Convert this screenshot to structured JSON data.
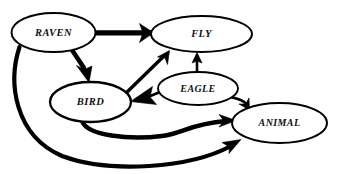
{
  "diagram": {
    "canvas": {
      "width": 338,
      "height": 174,
      "background": "#ffffff"
    },
    "style": {
      "node_fill": "#ffffff",
      "node_stroke": "#000000",
      "edge_color": "#000000",
      "label_color": "#111111"
    },
    "nodes": [
      {
        "id": "raven",
        "label": "RAVEN",
        "cx": 53.5,
        "cy": 32.5,
        "rx": 42,
        "ry": 19.5,
        "stroke_width": 1.9,
        "font_size": 10.5
      },
      {
        "id": "fly",
        "label": "FLY",
        "cx": 201.5,
        "cy": 34,
        "rx": 50.5,
        "ry": 18,
        "stroke_width": 1.9,
        "font_size": 10.5
      },
      {
        "id": "bird",
        "label": "BIRD",
        "cx": 90.5,
        "cy": 102,
        "rx": 40.5,
        "ry": 20,
        "stroke_width": 2.3,
        "font_size": 10.5
      },
      {
        "id": "eagle",
        "label": "EAGLE",
        "cx": 198,
        "cy": 88.5,
        "rx": 40,
        "ry": 16.5,
        "stroke_width": 1.9,
        "font_size": 10
      },
      {
        "id": "animal",
        "label": "ANIMAL",
        "cx": 279.5,
        "cy": 123,
        "rx": 47.5,
        "ry": 20,
        "stroke_width": 1.9,
        "font_size": 10
      }
    ],
    "edges": [
      {
        "id": "raven-fly",
        "from": "RAVEN",
        "to": "FLY",
        "weight": "thick",
        "stroke_width": 5.2,
        "path": "M 95 32.8 L 152 32.8",
        "arrow": "M 153.5 32.8 L 139.5 23.5 L 143 32.8 L 139.5 42.5 Z"
      },
      {
        "id": "raven-bird",
        "from": "RAVEN",
        "to": "BIRD",
        "weight": "thick",
        "stroke_width": 4.6,
        "path": "M 72 50 L 84 68",
        "arrow": "M 89 82.5 L 76.5 65.5 L 84.5 69.5 L 92 66 Z"
      },
      {
        "id": "raven-animal",
        "from": "RAVEN",
        "to": "ANIMAL",
        "weight": "thick",
        "stroke_width": 4.2,
        "path": "M 19.5 47 C 8 82, 14 135, 62 156 C 110 174, 190 168, 231 146",
        "arrow": "M 241 139.5 L 222 142.5 L 229.5 147 L 229 153.5 Z"
      },
      {
        "id": "bird-fly",
        "from": "BIRD",
        "to": "FLY",
        "weight": "medium",
        "stroke_width": 3.4,
        "path": "M 124 95 L 164 56",
        "arrow": "M 169.5 50.5 L 157.5 57 L 165 58 L 167.5 64.5 Z"
      },
      {
        "id": "bird-animal",
        "from": "BIRD",
        "to": "ANIMAL",
        "weight": "thick",
        "stroke_width": 4.6,
        "path": "M 82 120.5 C 86 136, 130 140, 162 136 C 184 133, 190 124, 226 121",
        "arrow": "M 236 120.5 L 219 114.5 L 224 121 L 219 127 Z"
      },
      {
        "id": "eagle-bird",
        "from": "EAGLE",
        "to": "BIRD",
        "weight": "medium",
        "stroke_width": 2.6,
        "path": "M 160 92 L 148 97",
        "arrow": "M 130.5 101.5 L 152.5 86.5 L 150 97 L 156.5 104.5 Z"
      },
      {
        "id": "eagle-fly",
        "from": "EAGLE",
        "to": "FLY",
        "weight": "medium",
        "stroke_width": 2.6,
        "path": "M 197 72.5 L 197 60",
        "arrow": "M 197 52.5 L 192 63 L 197 61 L 202 63 Z"
      },
      {
        "id": "eagle-animal",
        "from": "EAGLE",
        "to": "ANIMAL",
        "weight": "medium",
        "stroke_width": 2.6,
        "path": "M 229 96.5 C 238 99, 243 100, 246.5 104",
        "arrow": "M 249.5 110 L 249 98 L 245.5 104 L 239 104 Z"
      }
    ]
  }
}
